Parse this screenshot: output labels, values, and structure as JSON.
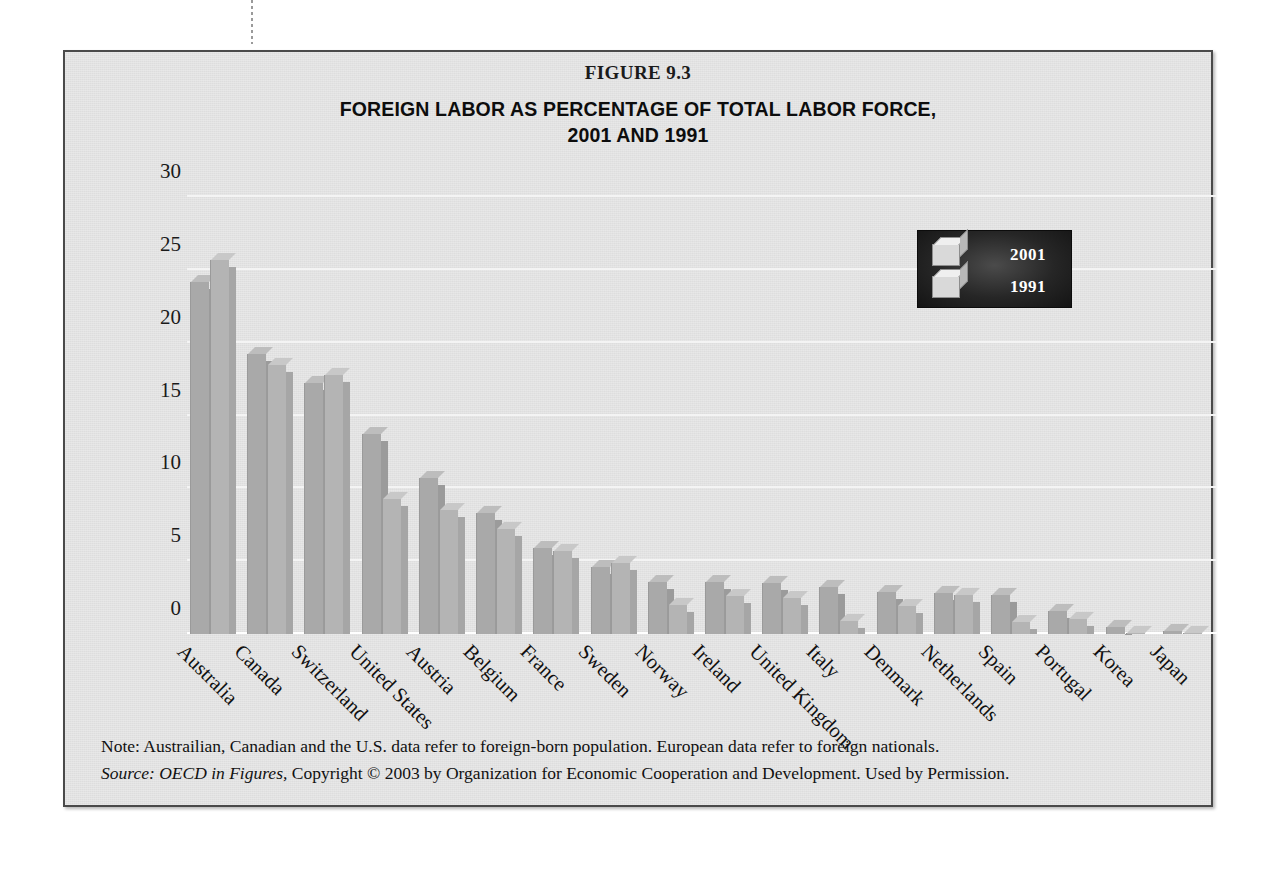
{
  "figure": {
    "number": "FIGURE 9.3",
    "title_line1": "FOREIGN LABOR AS PERCENTAGE OF TOTAL LABOR FORCE,",
    "title_line2": "2001 AND 1991"
  },
  "legend": {
    "series": [
      {
        "label": "2001",
        "swatch": "cube-icon-2001"
      },
      {
        "label": "1991",
        "swatch": "cube-icon-1991"
      }
    ]
  },
  "notes": {
    "note": "Note: Austrailian, Canadian and the U.S. data refer to foreign-born population. European data refer to foreign nationals.",
    "source_label": "Source:",
    "source_work": "OECD in Figures,",
    "source_rest": "Copyright © 2003 by Organization for Economic Cooperation and Development. Used by Permission."
  },
  "colors": {
    "panel_background": "#e2e2e2",
    "frame_border": "#4a4a4a",
    "bar_2001": "#a9a9a9",
    "bar_1991": "#b4b4b4",
    "gridline": "#f4f4f4",
    "legend_background": "#262626",
    "legend_text": "#ffffff",
    "text": "#111111"
  },
  "chart_data": {
    "type": "bar",
    "title": "FOREIGN LABOR AS PERCENTAGE OF TOTAL LABOR FORCE, 2001 AND 1991",
    "xlabel": "",
    "ylabel": "",
    "ylim": [
      0,
      30
    ],
    "yticks": [
      0,
      5,
      10,
      15,
      20,
      25,
      30
    ],
    "ytick_labels": [
      "0",
      "5",
      "10",
      "15",
      "20",
      "25",
      "30"
    ],
    "grid": true,
    "legend_position": "upper-right",
    "units": "percent",
    "categories": [
      "Australia",
      "Canada",
      "Switzerland",
      "United States",
      "Austria",
      "Belgium",
      "France",
      "Sweden",
      "Norway",
      "Ireland",
      "United Kingdom",
      "Italy",
      "Denmark",
      "Netherlands",
      "Spain",
      "Portugal",
      "Korea",
      "Japan"
    ],
    "series": [
      {
        "name": "2001",
        "values": [
          24.2,
          19.2,
          17.2,
          13.7,
          10.7,
          8.3,
          5.9,
          4.6,
          3.6,
          3.6,
          3.5,
          3.2,
          2.9,
          2.8,
          2.7,
          1.6,
          0.5,
          0.2
        ]
      },
      {
        "name": "1991",
        "values": [
          25.7,
          18.5,
          17.8,
          9.3,
          8.5,
          7.2,
          5.7,
          4.9,
          2.0,
          2.6,
          2.5,
          0.9,
          1.9,
          2.7,
          0.8,
          1.0,
          0.1,
          0.1
        ]
      }
    ]
  }
}
